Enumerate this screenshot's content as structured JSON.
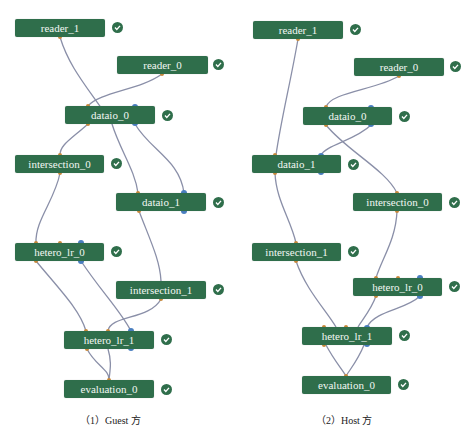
{
  "panels": [
    {
      "id": "guest",
      "caption": "（1）Guest 方",
      "nodes": [
        {
          "label": "reader_1",
          "x": 15,
          "y": 19,
          "w": 90,
          "status": "success"
        },
        {
          "label": "reader_0",
          "x": 117,
          "y": 56,
          "w": 91,
          "status": "success"
        },
        {
          "label": "dataio_0",
          "x": 65,
          "y": 106,
          "w": 90,
          "status": "success"
        },
        {
          "label": "intersection_0",
          "x": 15,
          "y": 155,
          "w": 89,
          "status": "success"
        },
        {
          "label": "dataio_1",
          "x": 116,
          "y": 193,
          "w": 90,
          "status": "success"
        },
        {
          "label": "hetero_lr_0",
          "x": 15,
          "y": 243,
          "w": 89,
          "status": "success"
        },
        {
          "label": "intersection_1",
          "x": 116,
          "y": 281,
          "w": 90,
          "status": "success"
        },
        {
          "label": "hetero_lr_1",
          "x": 64,
          "y": 331,
          "w": 90,
          "status": "success"
        },
        {
          "label": "evaluation_0",
          "x": 64,
          "y": 380,
          "w": 90,
          "status": "success"
        }
      ]
    },
    {
      "id": "host",
      "caption": "（2）Host 方",
      "nodes": [
        {
          "label": "reader_1",
          "x": 17,
          "y": 21,
          "w": 90,
          "status": "success"
        },
        {
          "label": "reader_0",
          "x": 118,
          "y": 58,
          "w": 90,
          "status": "success"
        },
        {
          "label": "dataio_0",
          "x": 67,
          "y": 107,
          "w": 89,
          "status": "success"
        },
        {
          "label": "dataio_1",
          "x": 16,
          "y": 155,
          "w": 89,
          "status": "success"
        },
        {
          "label": "intersection_0",
          "x": 117,
          "y": 193,
          "w": 89,
          "status": "success"
        },
        {
          "label": "intersection_1",
          "x": 16,
          "y": 243,
          "w": 89,
          "status": "success"
        },
        {
          "label": "hetero_lr_0",
          "x": 117,
          "y": 278,
          "w": 89,
          "status": "success"
        },
        {
          "label": "hetero_lr_1",
          "x": 66,
          "y": 327,
          "w": 90,
          "status": "success"
        },
        {
          "label": "evaluation_0",
          "x": 66,
          "y": 376,
          "w": 89,
          "status": "success"
        }
      ]
    }
  ],
  "colors": {
    "node_bg": "#2f6e4b",
    "node_text": "#f2f7f3",
    "edge": "#8a8fa8",
    "port_data": "#c98a3a",
    "port_model": "#4a7fc0",
    "check_bg": "#2f6e4b"
  }
}
